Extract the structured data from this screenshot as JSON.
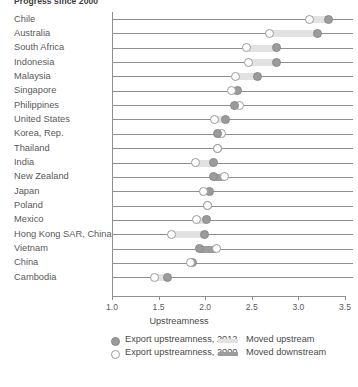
{
  "chart_data": {
    "type": "scatter",
    "title": "Progress since 2000",
    "xlabel": "Upstreamness",
    "ylabel": "",
    "xlim": [
      1.0,
      3.5
    ],
    "xticks": [
      "1.0",
      "1.5",
      "2.0",
      "2.5",
      "3.0",
      "3.5"
    ],
    "xtick_values": [
      1.0,
      1.5,
      2.0,
      2.5,
      3.0,
      3.5
    ],
    "grid": false,
    "legend_position": "bottom",
    "categories": [
      "Chile",
      "Australia",
      "South Africa",
      "Indonesia",
      "Malaysia",
      "Singapore",
      "Philippines",
      "United States",
      "Korea, Rep.",
      "Thailand",
      "India",
      "New Zealand",
      "Japan",
      "Poland",
      "Mexico",
      "Hong Kong SAR, China",
      "Vietnam",
      "China",
      "Cambodia"
    ],
    "series": [
      {
        "name": "Export upstreamness, 2012",
        "marker": "filled",
        "values": [
          3.32,
          3.2,
          2.77,
          2.77,
          2.56,
          2.35,
          2.31,
          2.22,
          2.13,
          2.13,
          2.09,
          2.09,
          2.05,
          2.02,
          2.01,
          1.99,
          1.94,
          1.86,
          1.6
        ]
      },
      {
        "name": "Export upstreamness, 2000",
        "marker": "open",
        "values": [
          3.12,
          2.69,
          2.44,
          2.46,
          2.32,
          2.28,
          2.37,
          2.1,
          2.17,
          2.13,
          1.9,
          2.21,
          1.98,
          2.02,
          1.91,
          1.64,
          2.12,
          1.84,
          1.46
        ]
      }
    ],
    "directions": [
      "upstream",
      "upstream",
      "upstream",
      "upstream",
      "upstream",
      "upstream",
      "downstream",
      "upstream",
      "downstream",
      "none",
      "upstream",
      "downstream",
      "upstream",
      "none",
      "upstream",
      "upstream",
      "downstream",
      "upstream",
      "upstream"
    ],
    "legend": [
      {
        "label": "Export upstreamness, 2012",
        "kind": "marker-filled"
      },
      {
        "label": "Export upstreamness, 2000",
        "kind": "marker-open"
      },
      {
        "label": "Moved upstream",
        "kind": "bar-up"
      },
      {
        "label": "Moved downstream",
        "kind": "bar-down"
      }
    ],
    "colors": {
      "marker_2012": "#9b9b9b",
      "marker_2000": "#ffffff",
      "moved_upstream": "#e2e2e2",
      "moved_downstream": "#9d9d9d",
      "axis": "#8e8e8e",
      "text": "#4a4a4a"
    }
  }
}
